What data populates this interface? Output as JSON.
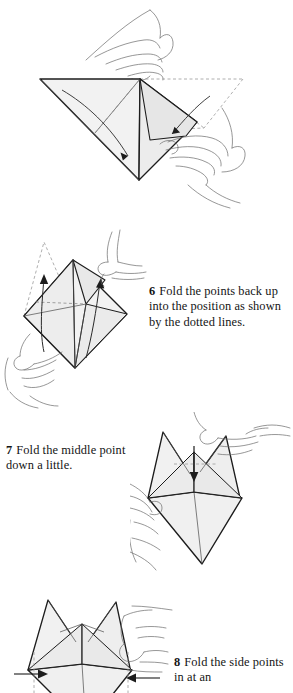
{
  "page": {
    "kind": "origami-instruction-page",
    "background_color": "#ffffff",
    "ink_color": "#141414",
    "paper_fill_color": "#f0f0f0",
    "paper_shade_color": "#e4e4e4",
    "width": 293,
    "height": 693
  },
  "steps": [
    {
      "number": "5",
      "text": "",
      "illustration": {
        "name": "triangle-fold-illustration",
        "description": "Two hands holding a large flat triangle of paper, folding a flap; dashed lines show the original position and solid arrows show the fold direction.",
        "arrows": [
          "down-left-arrow",
          "left-arrow"
        ],
        "dashed_guides": true
      }
    },
    {
      "number": "6",
      "text": "Fold the points back up into the position as shown by the dotted lines.",
      "illustration": {
        "name": "diamond-fold-up-illustration",
        "description": "Two hands holding a diamond-shaped folded paper; two solid arrows point up and dotted outlines show where the points should end up.",
        "arrows": [
          "up-arrow-left",
          "up-arrow-right"
        ],
        "dashed_guides": true
      }
    },
    {
      "number": "7",
      "text": "Fold the middle point down a little.",
      "illustration": {
        "name": "two-peak-fold-down-illustration",
        "description": "Hands holding a shape with two upward peaks; a short solid arrow points down at the centre point, with a dotted crease line across.",
        "arrows": [
          "down-arrow-center"
        ],
        "dashed_guides": true
      }
    },
    {
      "number": "8",
      "text": "Fold the side points in at an",
      "illustration": {
        "name": "side-points-fold-in-illustration",
        "description": "Hands holding the two-peak shape; horizontal arrows point inward from both sides. The panel is cropped by the bottom of the page.",
        "arrows": [
          "right-arrow-left-side",
          "left-arrow-right-side"
        ],
        "dashed_guides": true,
        "cropped": true
      }
    }
  ]
}
